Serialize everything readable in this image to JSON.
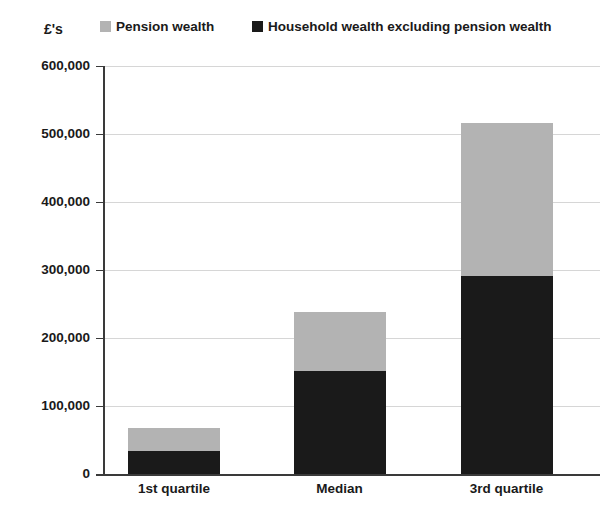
{
  "chart_data": {
    "type": "bar",
    "subtype": "stacked-vertical",
    "title": "",
    "xlabel": "",
    "ylabel": "£'s",
    "unit_label": "£'s",
    "categories": [
      "1st quartile",
      "Median",
      "3rd quartile"
    ],
    "series": [
      {
        "name": "Household wealth excluding pension wealth",
        "color": "#1a1a1a",
        "values": [
          34000,
          152000,
          291000
        ]
      },
      {
        "name": "Pension wealth",
        "color": "#b3b3b3",
        "values": [
          34000,
          86000,
          225000
        ]
      }
    ],
    "totals": [
      68000,
      238000,
      516000
    ],
    "ylim": [
      0,
      600000
    ],
    "ytick_values": [
      0,
      100000,
      200000,
      300000,
      400000,
      500000,
      600000
    ],
    "ytick_labels": [
      "0",
      "100,000",
      "200,000",
      "300,000",
      "400,000",
      "500,000",
      "600,000"
    ],
    "grid": true,
    "grid_axis": "y",
    "legend_position": "top",
    "legend": [
      {
        "label": "Pension wealth",
        "swatch": "#b3b3b3",
        "icon": "legend-swatch-icon"
      },
      {
        "label": "Household wealth excluding pension wealth",
        "swatch": "#1a1a1a",
        "icon": "legend-swatch-icon"
      }
    ]
  },
  "colors": {
    "pension": "#b3b3b3",
    "household": "#1a1a1a",
    "gridline": "#d6d6d6",
    "axis": "#3a3a3a",
    "background": "#ffffff"
  }
}
